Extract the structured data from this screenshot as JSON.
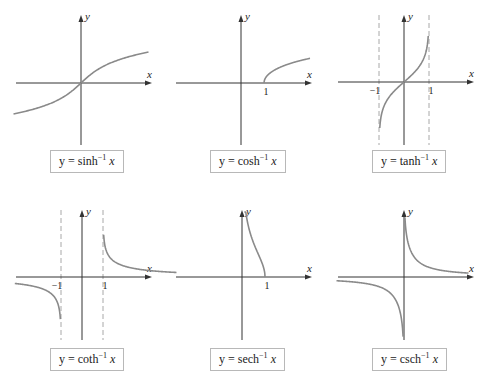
{
  "chart_data": [
    {
      "type": "line",
      "title": "y = sinh⁻¹ x",
      "label": {
        "lhs": "y = ",
        "fn": "sinh",
        "exp": "−1",
        "var": "x"
      },
      "xlabel": "x",
      "ylabel": "y",
      "function": "asinh",
      "xlim": [
        -4.5,
        4.5
      ],
      "ylim": [
        -3,
        3
      ],
      "domain": [
        -4.5,
        4.5
      ],
      "tick_labels": [],
      "asymptotes_x": []
    },
    {
      "type": "line",
      "title": "y = cosh⁻¹ x",
      "label": {
        "lhs": "y = ",
        "fn": "cosh",
        "exp": "−1",
        "var": "x"
      },
      "xlabel": "x",
      "ylabel": "y",
      "function": "acosh",
      "xlim": [
        -3,
        3
      ],
      "ylim": [
        -3,
        3
      ],
      "domain": [
        1,
        3
      ],
      "tick_labels": [
        {
          "x": 1,
          "text": "1"
        }
      ],
      "asymptotes_x": []
    },
    {
      "type": "line",
      "title": "y = tanh⁻¹ x",
      "label": {
        "lhs": "y = ",
        "fn": "tanh",
        "exp": "−1",
        "var": "x"
      },
      "xlabel": "x",
      "ylabel": "y",
      "function": "atanh",
      "xlim": [
        -2.5,
        2.5
      ],
      "ylim": [
        -3,
        3
      ],
      "domain": [
        -0.97,
        0.97
      ],
      "tick_labels": [
        {
          "x": -1,
          "text": "−1"
        },
        {
          "x": 1,
          "text": "1"
        }
      ],
      "asymptotes_x": [
        -1,
        1
      ]
    },
    {
      "type": "line",
      "title": "y = coth⁻¹ x",
      "label": {
        "lhs": "y = ",
        "fn": "coth",
        "exp": "−1",
        "var": "x"
      },
      "xlabel": "x",
      "ylabel": "y",
      "function": "acoth",
      "xlim": [
        -3.2,
        4.8
      ],
      "ylim": [
        -2.5,
        2.5
      ],
      "domain": [
        [
          -3.2,
          -1.03
        ],
        [
          1.03,
          4.5
        ]
      ],
      "tick_labels": [
        {
          "x": -1,
          "text": "−1"
        },
        {
          "x": 1,
          "text": "1"
        }
      ],
      "asymptotes_x": [
        -1,
        1
      ]
    },
    {
      "type": "line",
      "title": "y = sech⁻¹ x",
      "label": {
        "lhs": "y = ",
        "fn": "sech",
        "exp": "−1",
        "var": "x"
      },
      "xlabel": "x",
      "ylabel": "y",
      "function": "asech",
      "xlim": [
        -3,
        3
      ],
      "ylim": [
        -3,
        3
      ],
      "domain": [
        0.1,
        1
      ],
      "tick_labels": [
        {
          "x": 1,
          "text": "1"
        }
      ],
      "asymptotes_x": []
    },
    {
      "type": "line",
      "title": "y = csch⁻¹ x",
      "label": {
        "lhs": "y = ",
        "fn": "csch",
        "exp": "−1",
        "var": "x"
      },
      "xlabel": "x",
      "ylabel": "y",
      "function": "acsch",
      "xlim": [
        -4.5,
        4.5
      ],
      "ylim": [
        -3,
        3
      ],
      "domain": [
        [
          -4.5,
          -0.06
        ],
        [
          0.06,
          4.3
        ]
      ],
      "tick_labels": [],
      "asymptotes_x": []
    }
  ],
  "colors": {
    "curve": "#8a8a8a",
    "axis": "#333333",
    "asymptote": "#a8a8a8",
    "box_border": "#b8b8b8"
  }
}
